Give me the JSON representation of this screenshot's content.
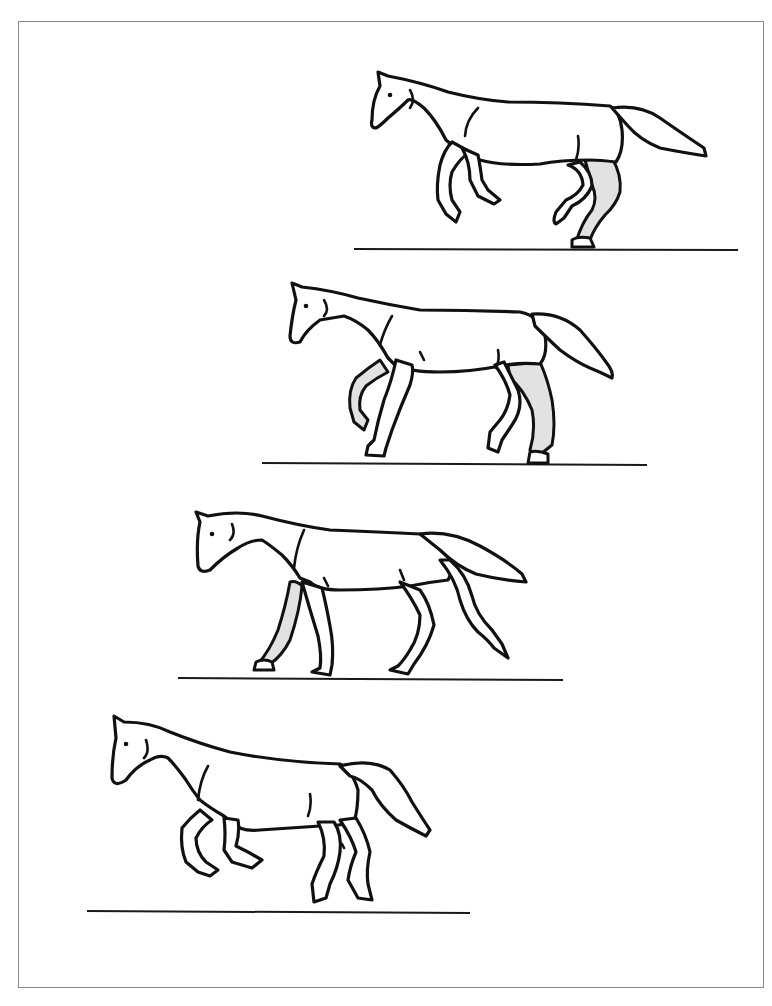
{
  "page": {
    "caption_fragment": "",
    "shade_color": "#e2e2e2",
    "line_color": "#111111"
  },
  "figures": [
    {
      "id": 1,
      "label": "phase-1",
      "pose": "suspension/gallop with hind leg shaded on ground"
    },
    {
      "id": 2,
      "label": "phase-2",
      "pose": "foreleg raised shaded, hind leg shaded planted"
    },
    {
      "id": 3,
      "label": "phase-3",
      "pose": "walking stride with near foreleg shaded"
    },
    {
      "id": 4,
      "label": "phase-4",
      "pose": "airborne collected stride, no shading"
    }
  ]
}
